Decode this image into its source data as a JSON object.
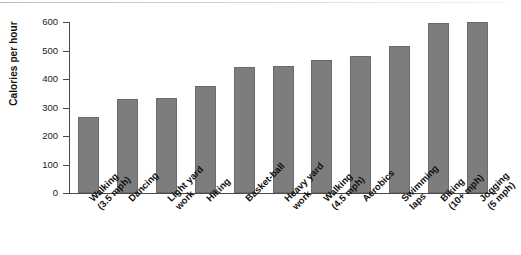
{
  "chart_data": {
    "type": "bar",
    "title": "",
    "subtitle": "",
    "xlabel": "",
    "ylabel": "Calories per hour",
    "ylim": [
      0,
      600
    ],
    "ytick_values": [
      0,
      100,
      200,
      300,
      400,
      500,
      600
    ],
    "ytick_labels": [
      "0",
      "100",
      "200",
      "300",
      "400",
      "500",
      "600"
    ],
    "grid": false,
    "legend": false,
    "bar_color": "#7d7d7d",
    "bar_edge_color": "#6a6a6a",
    "axis_color": "#4a4a4a",
    "categories": [
      "Walking (3.5 mph)",
      "Dancing",
      "Light yard work",
      "Hiking",
      "Basket-ball",
      "Heavy yard work",
      "Walking (4.5 mph)",
      "Aerobics",
      "Swimming laps",
      "Biking (10+ mph)",
      "Jogging (5 mph)"
    ],
    "category_lines": [
      [
        "Walking",
        "(3.5 mph)"
      ],
      [
        "Dancing",
        ""
      ],
      [
        "Light yard",
        "work"
      ],
      [
        "Hiking",
        ""
      ],
      [
        "Basket-ball",
        ""
      ],
      [
        "Heavy yard",
        "work"
      ],
      [
        "Walking",
        "(4.5 mph)"
      ],
      [
        "Aerobics",
        ""
      ],
      [
        "Swimming",
        "laps"
      ],
      [
        "Biking",
        "(10+ mph)"
      ],
      [
        "Jogging",
        "(5 mph)"
      ]
    ],
    "values": [
      268,
      330,
      332,
      374,
      443,
      444,
      466,
      482,
      517,
      597,
      599
    ]
  }
}
